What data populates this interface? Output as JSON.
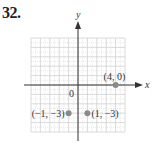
{
  "problem": {
    "number": "32."
  },
  "chart_data": {
    "type": "scatter",
    "title": "",
    "xlabel": "x",
    "ylabel": "y",
    "xlim": [
      -5,
      5
    ],
    "ylim": [
      -5,
      5
    ],
    "grid": true,
    "origin_label": "0",
    "points": [
      {
        "x": 4,
        "y": 0,
        "label": "(4, 0)"
      },
      {
        "x": -1,
        "y": -3,
        "label": "(−1, −3)"
      },
      {
        "x": 1,
        "y": -3,
        "label": "(1, −3)"
      }
    ],
    "point_color": "#8a8a8a",
    "axis_color": "#333333",
    "grid_color": "#d0d0d0"
  }
}
